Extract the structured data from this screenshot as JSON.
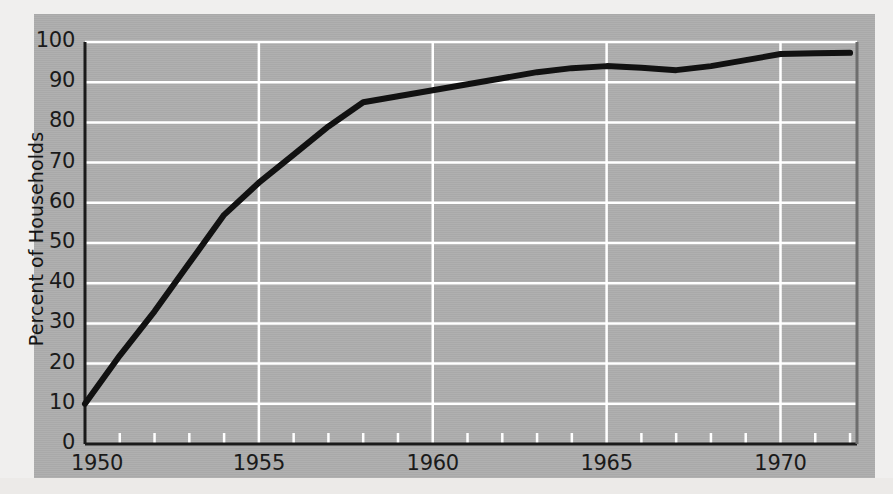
{
  "chart_data": {
    "type": "line",
    "title": "",
    "subtitle": "",
    "xlabel": "",
    "ylabel": "Percent of Households",
    "xlim": [
      1950,
      1972.2
    ],
    "ylim": [
      0,
      100
    ],
    "grid": true,
    "legend": null,
    "background_color": "#adadad",
    "gridline_color": "#ffffff",
    "line_color": "#111111",
    "axis_color": "#1a1a1a",
    "x_tick_labels": [
      "1950",
      "1955",
      "1960",
      "1965",
      "1970"
    ],
    "x_tick_values": [
      1950,
      1955,
      1960,
      1965,
      1970
    ],
    "x_minor_tick_values": [
      1951,
      1952,
      1953,
      1954,
      1956,
      1957,
      1958,
      1959,
      1961,
      1962,
      1963,
      1964,
      1966,
      1967,
      1968,
      1969,
      1971,
      1972
    ],
    "y_tick_labels": [
      "0",
      "10",
      "20",
      "30",
      "40",
      "50",
      "60",
      "70",
      "80",
      "90",
      "100"
    ],
    "y_tick_values": [
      0,
      10,
      20,
      30,
      40,
      50,
      60,
      70,
      80,
      90,
      100
    ],
    "series": [
      {
        "name": "Percent of Households",
        "x": [
          1950,
          1951,
          1952,
          1953,
          1954,
          1955,
          1956,
          1957,
          1958,
          1959,
          1960,
          1961,
          1962,
          1963,
          1964,
          1965,
          1966,
          1967,
          1968,
          1969,
          1970,
          1971,
          1972
        ],
        "values": [
          10,
          22,
          33,
          45,
          57,
          65,
          72,
          79,
          85,
          86.5,
          88,
          89.5,
          91,
          92.5,
          93.5,
          94,
          93.6,
          93,
          94,
          95.5,
          97,
          97.2,
          97.3
        ]
      }
    ]
  },
  "axis": {
    "y_title": "Percent of Households"
  }
}
